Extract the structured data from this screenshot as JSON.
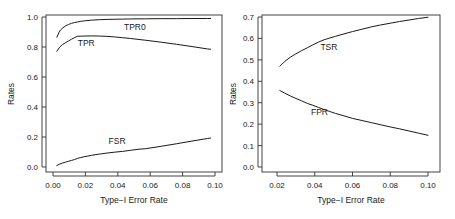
{
  "figure": {
    "width": 455,
    "height": 219,
    "background": "#ffffff",
    "line_color": "#1a1a1a",
    "axis_color": "#303030"
  },
  "chart_data": [
    {
      "type": "line",
      "panel": "left",
      "title": "",
      "xlabel": "Type−I Error Rate",
      "ylabel": "Rates",
      "xlim": [
        0.0,
        0.105
      ],
      "ylim": [
        0.0,
        1.02
      ],
      "xticks": [
        0.0,
        0.02,
        0.04,
        0.06,
        0.08,
        0.1
      ],
      "xtick_labels": [
        "0.00",
        "0.02",
        "0.04",
        "0.06",
        "0.08",
        "0.10"
      ],
      "yticks": [
        0.0,
        0.2,
        0.4,
        0.6,
        0.8,
        1.0
      ],
      "ytick_labels": [
        "0.0",
        "0.2",
        "0.4",
        "0.6",
        "0.8",
        "1.0"
      ],
      "grid": false,
      "legend": "inline-annotations",
      "annotations": [
        {
          "text": "TPR0",
          "x": 0.053,
          "y": 0.915
        },
        {
          "text": "TPR",
          "x": 0.0215,
          "y": 0.805
        },
        {
          "text": "FSR",
          "x": 0.0415,
          "y": 0.152
        }
      ],
      "series": [
        {
          "name": "TPR0",
          "x": [
            0.0025,
            0.004,
            0.005,
            0.006,
            0.008,
            0.01,
            0.012,
            0.014,
            0.016,
            0.018,
            0.02,
            0.025,
            0.03,
            0.035,
            0.04,
            0.045,
            0.05,
            0.06,
            0.07,
            0.08,
            0.09,
            0.1,
            0.102
          ],
          "values": [
            0.865,
            0.9,
            0.915,
            0.925,
            0.94,
            0.95,
            0.958,
            0.963,
            0.967,
            0.971,
            0.974,
            0.979,
            0.982,
            0.984,
            0.985,
            0.986,
            0.987,
            0.988,
            0.989,
            0.989,
            0.99,
            0.99,
            0.99
          ]
        },
        {
          "name": "TPR",
          "x": [
            0.0025,
            0.004,
            0.005,
            0.006,
            0.008,
            0.01,
            0.012,
            0.014,
            0.016,
            0.018,
            0.02,
            0.025,
            0.03,
            0.035,
            0.04,
            0.045,
            0.05,
            0.06,
            0.07,
            0.08,
            0.09,
            0.1,
            0.102
          ],
          "values": [
            0.772,
            0.795,
            0.806,
            0.815,
            0.828,
            0.84,
            0.852,
            0.863,
            0.872,
            0.872,
            0.873,
            0.874,
            0.873,
            0.871,
            0.867,
            0.862,
            0.857,
            0.845,
            0.832,
            0.818,
            0.803,
            0.787,
            0.785
          ]
        },
        {
          "name": "FSR",
          "x": [
            0.0025,
            0.004,
            0.006,
            0.008,
            0.01,
            0.012,
            0.014,
            0.016,
            0.018,
            0.02,
            0.025,
            0.03,
            0.035,
            0.04,
            0.045,
            0.05,
            0.055,
            0.06,
            0.07,
            0.08,
            0.09,
            0.1,
            0.102
          ],
          "values": [
            0.01,
            0.018,
            0.026,
            0.032,
            0.038,
            0.044,
            0.05,
            0.058,
            0.063,
            0.068,
            0.078,
            0.086,
            0.093,
            0.099,
            0.104,
            0.111,
            0.118,
            0.122,
            0.138,
            0.155,
            0.173,
            0.19,
            0.193
          ]
        }
      ]
    },
    {
      "type": "line",
      "panel": "right",
      "title": "",
      "xlabel": "Type−I Error Rate",
      "ylabel": "Rates",
      "xlim": [
        0.019,
        0.1015
      ],
      "ylim": [
        0.0,
        0.715
      ],
      "xticks": [
        0.02,
        0.04,
        0.06,
        0.08,
        0.1
      ],
      "xtick_labels": [
        "0.02",
        "0.04",
        "0.06",
        "0.08",
        "0.10"
      ],
      "yticks": [
        0.0,
        0.1,
        0.2,
        0.3,
        0.4,
        0.5,
        0.6,
        0.7
      ],
      "ytick_labels": [
        "0.0",
        "0.1",
        "0.2",
        "0.3",
        "0.4",
        "0.5",
        "0.6",
        "0.7"
      ],
      "grid": false,
      "legend": "inline-annotations",
      "annotations": [
        {
          "text": "TSR",
          "x": 0.0475,
          "y": 0.545
        },
        {
          "text": "FPR",
          "x": 0.0425,
          "y": 0.243
        }
      ],
      "series": [
        {
          "name": "TSR",
          "x": [
            0.0215,
            0.024,
            0.027,
            0.03,
            0.033,
            0.036,
            0.039,
            0.042,
            0.045,
            0.048,
            0.051,
            0.055,
            0.06,
            0.065,
            0.07,
            0.075,
            0.08,
            0.085,
            0.09,
            0.095,
            0.1
          ],
          "values": [
            0.47,
            0.492,
            0.512,
            0.528,
            0.543,
            0.556,
            0.57,
            0.583,
            0.594,
            0.602,
            0.61,
            0.62,
            0.632,
            0.643,
            0.654,
            0.663,
            0.671,
            0.679,
            0.686,
            0.693,
            0.699
          ]
        },
        {
          "name": "FPR",
          "x": [
            0.0215,
            0.024,
            0.027,
            0.03,
            0.033,
            0.036,
            0.039,
            0.042,
            0.045,
            0.048,
            0.051,
            0.055,
            0.06,
            0.065,
            0.07,
            0.075,
            0.08,
            0.085,
            0.09,
            0.095,
            0.1
          ],
          "values": [
            0.357,
            0.345,
            0.332,
            0.32,
            0.309,
            0.297,
            0.288,
            0.278,
            0.268,
            0.259,
            0.25,
            0.24,
            0.227,
            0.217,
            0.207,
            0.197,
            0.187,
            0.178,
            0.168,
            0.158,
            0.148
          ]
        }
      ]
    }
  ]
}
